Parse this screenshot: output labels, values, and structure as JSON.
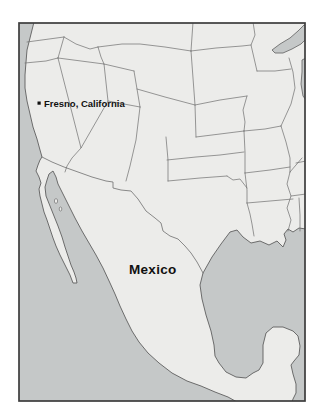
{
  "map": {
    "city_label": "Fresno, California",
    "country_label": "Mexico",
    "colors": {
      "page_bg": "#ffffff",
      "water": "#c5c8c8",
      "land": "#ececea",
      "border_line": "#6e6e6e",
      "coast_line": "#5f5f5f",
      "frame": "#3d3d3d",
      "label": "#111111"
    }
  }
}
